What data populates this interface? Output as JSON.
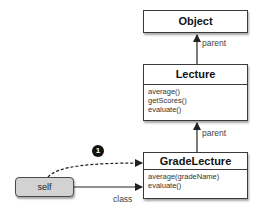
{
  "diagram": {
    "classes": [
      {
        "name": "Object",
        "methods": []
      },
      {
        "name": "Lecture",
        "methods": [
          "average()",
          "getScores()",
          "evaluate()"
        ]
      },
      {
        "name": "GradeLecture",
        "methods": [
          "average(gradeName)",
          "evaluate()"
        ]
      }
    ],
    "instance": {
      "label": "self"
    },
    "edges": [
      {
        "from": "Lecture",
        "to": "Object",
        "label": "parent",
        "style": "solid"
      },
      {
        "from": "GradeLecture",
        "to": "Lecture",
        "label": "parent",
        "style": "solid"
      },
      {
        "from": "self",
        "to": "GradeLecture",
        "label": "class",
        "style": "solid"
      },
      {
        "from": "self",
        "to": "GradeLecture",
        "label": "",
        "style": "dashed",
        "marker": "1"
      }
    ],
    "labels": {
      "parent1": "parent",
      "parent2": "parent",
      "class": "class",
      "badge": "1"
    },
    "colors": {
      "self_fill": "#d2d2d2",
      "border": "#3a3a3a",
      "badge": "#111111"
    }
  }
}
